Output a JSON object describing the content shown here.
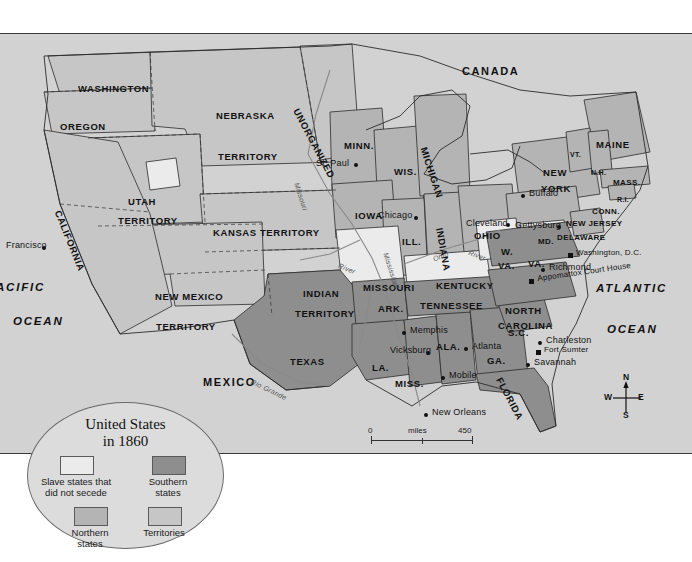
{
  "map": {
    "title_block": {
      "line1": "United States",
      "line2": "in 1860"
    },
    "legend": {
      "items": [
        {
          "label": "Slave states that\ndid not secede",
          "swatch": "#ebebeb"
        },
        {
          "label": "Southern\nstates",
          "swatch": "#8e8e8e"
        },
        {
          "label": "Northern\nstates",
          "swatch": "#b4b4b4"
        },
        {
          "label": "Territories",
          "swatch": "#c6c6c6"
        }
      ]
    },
    "scale": {
      "miles_label": "miles",
      "miles_min": "0",
      "miles_max": "450",
      "km_label": "kilometers",
      "km_min": "0",
      "km_max": "570"
    },
    "compass": {
      "n": "N",
      "s": "S",
      "e": "E",
      "w": "W"
    },
    "countries": [
      {
        "name": "CANADA",
        "x": 462,
        "y": 32
      },
      {
        "name": "MEXICO",
        "x": 203,
        "y": 343
      }
    ],
    "oceans": [
      {
        "name": "ACIFIC",
        "x": 0,
        "y": 248
      },
      {
        "name": "OCEAN",
        "x": 13,
        "y": 282
      },
      {
        "name": "ATLANTIC",
        "x": 596,
        "y": 249
      },
      {
        "name": "OCEAN",
        "x": 607,
        "y": 290
      }
    ],
    "states": [
      {
        "name": "WASHINGTON",
        "x": 78,
        "y": 50,
        "size": "state"
      },
      {
        "name": "OREGON",
        "x": 60,
        "y": 88,
        "size": "state"
      },
      {
        "name": "CALIFORNIA",
        "x": 62,
        "y": 175,
        "size": "state",
        "rot": 68
      },
      {
        "name": "NEBRASKA",
        "x": 216,
        "y": 77,
        "size": "state"
      },
      {
        "name": "TERRITORY",
        "x": 218,
        "y": 118,
        "size": "state"
      },
      {
        "name": "UNORGANIZED",
        "x": 300,
        "y": 73,
        "size": "state",
        "rot": 62
      },
      {
        "name": "UTAH",
        "x": 128,
        "y": 163,
        "size": "state"
      },
      {
        "name": "TERRITORY",
        "x": 118,
        "y": 182,
        "size": "state"
      },
      {
        "name": "KANSAS TERRITORY",
        "x": 213,
        "y": 194,
        "size": "state"
      },
      {
        "name": "NEW MEXICO",
        "x": 155,
        "y": 258,
        "size": "state"
      },
      {
        "name": "TERRITORY",
        "x": 156,
        "y": 288,
        "size": "state"
      },
      {
        "name": "INDIAN",
        "x": 303,
        "y": 255,
        "size": "state"
      },
      {
        "name": "TERRITORY",
        "x": 295,
        "y": 275,
        "size": "state"
      },
      {
        "name": "TEXAS",
        "x": 290,
        "y": 323,
        "size": "state"
      },
      {
        "name": "MINN.",
        "x": 344,
        "y": 107,
        "size": "state"
      },
      {
        "name": "WIS.",
        "x": 394,
        "y": 133,
        "size": "state"
      },
      {
        "name": "MICHIGAN",
        "x": 428,
        "y": 112,
        "size": "state",
        "rot": 72
      },
      {
        "name": "IOWA",
        "x": 355,
        "y": 177,
        "size": "state"
      },
      {
        "name": "ILL.",
        "x": 402,
        "y": 203,
        "size": "state"
      },
      {
        "name": "INDIANA",
        "x": 444,
        "y": 193,
        "size": "state",
        "rot": 80
      },
      {
        "name": "OHIO",
        "x": 474,
        "y": 197,
        "size": "state"
      },
      {
        "name": "MISSOURI",
        "x": 363,
        "y": 249,
        "size": "state"
      },
      {
        "name": "KENTUCKY",
        "x": 436,
        "y": 247,
        "size": "state"
      },
      {
        "name": "ARK.",
        "x": 378,
        "y": 270,
        "size": "state"
      },
      {
        "name": "TENNESSEE",
        "x": 420,
        "y": 267,
        "size": "state"
      },
      {
        "name": "LA.",
        "x": 372,
        "y": 329,
        "size": "state"
      },
      {
        "name": "MISS.",
        "x": 395,
        "y": 345,
        "size": "state"
      },
      {
        "name": "ALA.",
        "x": 436,
        "y": 308,
        "size": "state"
      },
      {
        "name": "GA.",
        "x": 487,
        "y": 322,
        "size": "state"
      },
      {
        "name": "FLORIDA",
        "x": 503,
        "y": 342,
        "size": "state",
        "rot": 62
      },
      {
        "name": "S.C.",
        "x": 508,
        "y": 294,
        "size": "state"
      },
      {
        "name": "NORTH",
        "x": 505,
        "y": 272,
        "size": "state"
      },
      {
        "name": "CAROLINA",
        "x": 498,
        "y": 287,
        "size": "state"
      },
      {
        "name": "VA.",
        "x": 528,
        "y": 225,
        "size": "state"
      },
      {
        "name": "W.",
        "x": 501,
        "y": 213,
        "size": "state"
      },
      {
        "name": "VA.",
        "x": 498,
        "y": 227,
        "size": "state"
      },
      {
        "name": "MD.",
        "x": 538,
        "y": 204,
        "size": "state sm"
      },
      {
        "name": "DELAWARE",
        "x": 557,
        "y": 200,
        "size": "state sm"
      },
      {
        "name": "NEW JERSEY",
        "x": 566,
        "y": 186,
        "size": "state sm"
      },
      {
        "name": "CONN.",
        "x": 592,
        "y": 174,
        "size": "state sm"
      },
      {
        "name": "R.I.",
        "x": 617,
        "y": 162,
        "size": "state xs"
      },
      {
        "name": "MASS.",
        "x": 613,
        "y": 145,
        "size": "state sm"
      },
      {
        "name": "N.H.",
        "x": 591,
        "y": 135,
        "size": "state xs"
      },
      {
        "name": "VT.",
        "x": 570,
        "y": 117,
        "size": "state xs"
      },
      {
        "name": "MAINE",
        "x": 596,
        "y": 106,
        "size": "state"
      },
      {
        "name": "NEW",
        "x": 543,
        "y": 134,
        "size": "state"
      },
      {
        "name": "YORK",
        "x": 541,
        "y": 150,
        "size": "state"
      }
    ],
    "cities": [
      {
        "name": "Francisco",
        "x": 6,
        "y": 207,
        "dx": 42,
        "dy": 4
      },
      {
        "name": "St. Paul",
        "x": 316,
        "y": 125,
        "dx": 44,
        "dy": 3
      },
      {
        "name": "Chicago",
        "x": 378,
        "y": 177,
        "dx": 42,
        "dy": 4
      },
      {
        "name": "Cleveland",
        "x": 466,
        "y": 185,
        "dx": 46,
        "dy": 3
      },
      {
        "name": "Buffalo",
        "x": 523,
        "y": 155,
        "dx": -8,
        "dy": 4
      },
      {
        "name": "Gettysburg",
        "x": 515,
        "y": 187,
        "dx": 48,
        "dy": 3
      },
      {
        "name": "Washington, D.C.",
        "x": 570,
        "y": 215,
        "dx": -6,
        "dy": 3,
        "sq": true
      },
      {
        "name": "Richmond",
        "x": 543,
        "y": 229,
        "dx": -6,
        "dy": 4
      },
      {
        "name": "Appomattox Court House",
        "x": 531,
        "y": 241,
        "dx": -6,
        "dy": 3,
        "sq": true,
        "rot": -8
      },
      {
        "name": "Memphis",
        "x": 404,
        "y": 292,
        "dx": -6,
        "dy": 4
      },
      {
        "name": "Vicksburg",
        "x": 390,
        "y": 312,
        "dx": 42,
        "dy": 4
      },
      {
        "name": "Atlanta",
        "x": 466,
        "y": 308,
        "dx": -6,
        "dy": 4
      },
      {
        "name": "Mobile",
        "x": 443,
        "y": 337,
        "dx": -6,
        "dy": 4
      },
      {
        "name": "New Orleans",
        "x": 426,
        "y": 374,
        "dx": -10,
        "dy": 4
      },
      {
        "name": "Charleston",
        "x": 540,
        "y": 302,
        "dx": -6,
        "dy": 4
      },
      {
        "name": "Fort Sumter",
        "x": 538,
        "y": 312,
        "dx": -6,
        "dy": 3,
        "sq": true
      },
      {
        "name": "Savannah",
        "x": 528,
        "y": 324,
        "dx": -6,
        "dy": 4
      }
    ],
    "rivers": [
      {
        "name": "Missouri",
        "x": 300,
        "y": 148,
        "rot": 72
      },
      {
        "name": "Mississippi",
        "x": 389,
        "y": 218,
        "rot": 72
      },
      {
        "name": "River",
        "x": 340,
        "y": 228,
        "rot": 22
      },
      {
        "name": "Ohio",
        "x": 432,
        "y": 222,
        "rot": -22
      },
      {
        "name": "River",
        "x": 470,
        "y": 215,
        "rot": 20
      },
      {
        "name": "Rio Grande",
        "x": 253,
        "y": 344,
        "rot": 26
      }
    ]
  }
}
